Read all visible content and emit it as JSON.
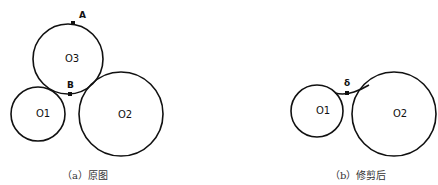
{
  "panel_a": {
    "caption": "（a）原图",
    "circles": [
      {
        "id": "O3",
        "label": "O3"
      },
      {
        "id": "O1",
        "label": "O1"
      },
      {
        "id": "O2",
        "label": "O2"
      }
    ],
    "points": [
      {
        "id": "A",
        "label": "A"
      },
      {
        "id": "B",
        "label": "B"
      }
    ]
  },
  "panel_b": {
    "caption": "（b）修剪后",
    "circles": [
      {
        "id": "O1",
        "label": "O1"
      },
      {
        "id": "O2",
        "label": "O2"
      }
    ],
    "points": [
      {
        "id": "delta",
        "label": "δ"
      }
    ]
  },
  "colors": {
    "stroke": "#111111",
    "background": "#ffffff"
  }
}
